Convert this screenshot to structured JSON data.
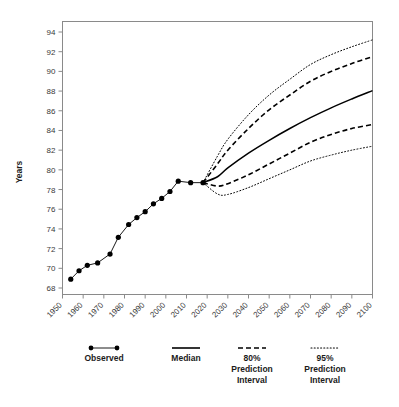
{
  "chart_data": {
    "type": "line",
    "title": "",
    "xlabel": "",
    "ylabel": "Years",
    "xlim": [
      1950,
      2100
    ],
    "ylim": [
      67,
      95
    ],
    "grid": false,
    "xticks": [
      1950,
      1960,
      1970,
      1980,
      1990,
      2000,
      2010,
      2020,
      2030,
      2040,
      2050,
      2060,
      2070,
      2080,
      2090,
      2100
    ],
    "yticks": [
      68,
      70,
      72,
      74,
      76,
      78,
      80,
      82,
      84,
      86,
      88,
      90,
      92,
      94
    ],
    "legend_position": "bottom",
    "series": [
      {
        "name": "Observed",
        "style": "line-markers",
        "x": [
          1954,
          1958,
          1962,
          1967,
          1973,
          1977,
          1982,
          1986,
          1990,
          1994,
          1998,
          2002,
          2006,
          2012,
          2018
        ],
        "values": [
          68.9,
          69.75,
          70.3,
          70.55,
          71.45,
          73.15,
          74.45,
          75.15,
          75.75,
          76.55,
          77.1,
          77.8,
          78.85,
          78.7,
          78.7
        ]
      },
      {
        "name": "Median",
        "style": "solid",
        "x": [
          2018,
          2025,
          2030,
          2040,
          2050,
          2060,
          2070,
          2080,
          2090,
          2100
        ],
        "values": [
          78.7,
          79.3,
          80.2,
          81.7,
          83.0,
          84.2,
          85.3,
          86.3,
          87.2,
          88.05
        ]
      },
      {
        "name": "80% Prediction Interval Upper",
        "style": "dashed",
        "x": [
          2018,
          2025,
          2030,
          2040,
          2050,
          2060,
          2070,
          2080,
          2090,
          2100
        ],
        "values": [
          78.7,
          80.6,
          82.0,
          84.2,
          86.1,
          87.6,
          89.0,
          90.0,
          90.8,
          91.5
        ]
      },
      {
        "name": "80% Prediction Interval Lower",
        "style": "dashed",
        "x": [
          2018,
          2025,
          2030,
          2040,
          2050,
          2060,
          2070,
          2080,
          2090,
          2100
        ],
        "values": [
          78.7,
          78.35,
          78.6,
          79.5,
          80.6,
          81.7,
          82.8,
          83.6,
          84.2,
          84.6
        ]
      },
      {
        "name": "95% Prediction Interval Upper",
        "style": "dotted",
        "x": [
          2018,
          2025,
          2030,
          2040,
          2050,
          2060,
          2070,
          2080,
          2090,
          2100
        ],
        "values": [
          78.7,
          81.4,
          83.1,
          85.6,
          87.6,
          89.2,
          90.7,
          91.7,
          92.5,
          93.2
        ]
      },
      {
        "name": "95% Prediction Interval Lower",
        "style": "dotted",
        "x": [
          2018,
          2025,
          2030,
          2040,
          2050,
          2060,
          2070,
          2080,
          2090,
          2100
        ],
        "values": [
          78.7,
          77.55,
          77.5,
          78.2,
          79.1,
          80.0,
          80.9,
          81.5,
          82.0,
          82.4
        ]
      }
    ]
  },
  "axes": {
    "y_title": "Years",
    "y_tick_labels": [
      "94",
      "92",
      "90",
      "88",
      "86",
      "84",
      "82",
      "80",
      "78",
      "76",
      "74",
      "72",
      "70",
      "68"
    ],
    "x_tick_labels": [
      "1950",
      "1960",
      "1970",
      "1980",
      "1990",
      "2000",
      "2010",
      "2020",
      "2030",
      "2040",
      "2050",
      "2060",
      "2070",
      "2080",
      "2090",
      "2100"
    ]
  },
  "legend": {
    "items": [
      {
        "id": "observed",
        "label": "Observed",
        "label2": "",
        "label3": "",
        "swatch": "line-markers"
      },
      {
        "id": "median",
        "label": "Median",
        "label2": "",
        "label3": "",
        "swatch": "solid"
      },
      {
        "id": "pi80",
        "label": "80%",
        "label2": "Prediction",
        "label3": "Interval",
        "swatch": "dashed"
      },
      {
        "id": "pi95",
        "label": "95%",
        "label2": "Prediction",
        "label3": "Interval",
        "swatch": "dotted"
      }
    ]
  },
  "colors": {
    "line": "#000000",
    "frame": "#777777",
    "tick_text": "#3a3a3a",
    "background": "#ffffff"
  }
}
